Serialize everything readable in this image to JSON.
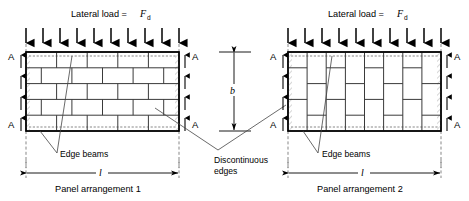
{
  "figure": {
    "load_label_prefix": "Lateral load =",
    "load_symbol": "F",
    "load_subscript": "d",
    "support_marker": "A",
    "height_symbol": "b",
    "length_symbol": "l",
    "edge_beams_label": "Edge beams",
    "discontinuous_edges_label_line1": "Discontinuous",
    "discontinuous_edges_label_line2": "edges",
    "panel1_caption": "Panel arrangement 1",
    "panel2_caption": "Panel arrangement 2",
    "colors": {
      "stroke": "#000000",
      "brick": "#3a3a3a",
      "beam_dash": "#7a7a7a",
      "leader": "#444444",
      "background": "#ffffff"
    }
  },
  "panels": [
    {
      "id": "panel-1",
      "caption": "Panel arrangement 1",
      "bond": "running-bond-horizontal",
      "x": 26,
      "y": 52,
      "width": 153,
      "height": 79,
      "rows": 5,
      "load_arrow_count": 10,
      "reaction_arrow_count": 4,
      "support_markers": [
        "A",
        "A"
      ]
    },
    {
      "id": "panel-2",
      "caption": "Panel arrangement 2",
      "bond": "running-bond-vertical",
      "x": 288,
      "y": 52,
      "width": 153,
      "height": 79,
      "columns": 8,
      "load_arrow_count": 10,
      "reaction_arrow_count": 4,
      "support_markers": [
        "A",
        "A"
      ]
    }
  ],
  "annotations": {
    "height_dim": {
      "symbol": "b",
      "x": 234,
      "top": 52,
      "bottom": 131
    },
    "panel1_length_dim": {
      "symbol": "l",
      "y": 173,
      "left": 26,
      "right": 179
    },
    "panel2_length_dim": {
      "symbol": "l",
      "y": 173,
      "left": 288,
      "right": 441
    }
  }
}
